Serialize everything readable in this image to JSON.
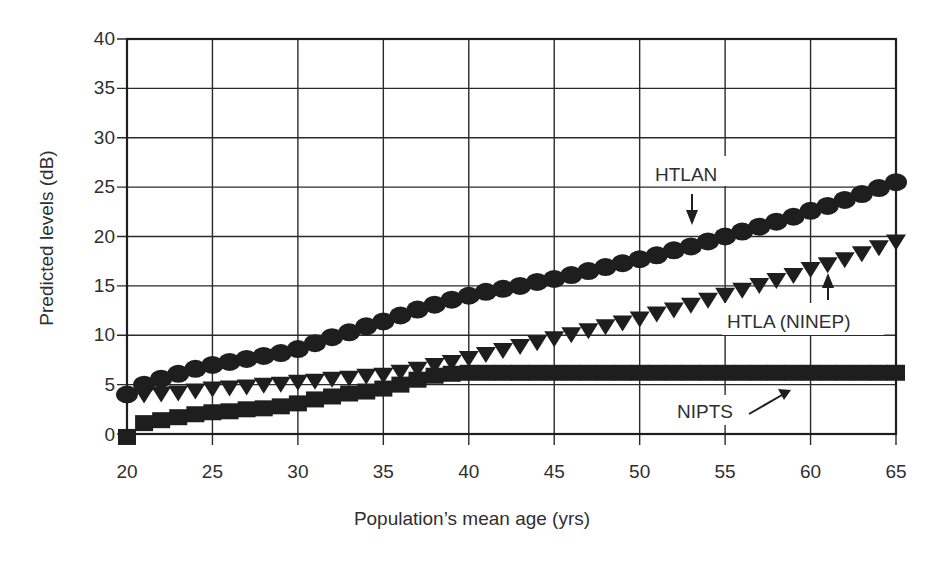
{
  "chart_data": {
    "type": "scatter",
    "title": "",
    "xlabel": "Population’s mean age (yrs)",
    "ylabel": "Predicted levels (dB)",
    "xlim": [
      20,
      65
    ],
    "ylim": [
      0,
      40
    ],
    "x_ticks": [
      20,
      25,
      30,
      35,
      40,
      45,
      50,
      55,
      60,
      65
    ],
    "y_ticks": [
      0,
      5,
      10,
      15,
      20,
      25,
      30,
      35,
      40
    ],
    "grid": true,
    "legend": "none (inline annotations with arrows)",
    "series": [
      {
        "name": "HTLAN",
        "marker": "circle",
        "x": [
          20,
          21,
          22,
          23,
          24,
          25,
          26,
          27,
          28,
          29,
          30,
          31,
          32,
          33,
          34,
          35,
          36,
          37,
          38,
          39,
          40,
          41,
          42,
          43,
          44,
          45,
          46,
          47,
          48,
          49,
          50,
          51,
          52,
          53,
          54,
          55,
          56,
          57,
          58,
          59,
          60,
          61,
          62,
          63,
          64,
          65
        ],
        "values": [
          4.0,
          5.0,
          5.6,
          6.1,
          6.6,
          7.0,
          7.3,
          7.6,
          7.9,
          8.2,
          8.6,
          9.2,
          9.8,
          10.3,
          10.9,
          11.4,
          12.0,
          12.6,
          13.1,
          13.6,
          14.0,
          14.4,
          14.7,
          15.0,
          15.4,
          15.7,
          16.1,
          16.5,
          16.9,
          17.3,
          17.7,
          18.1,
          18.6,
          19.0,
          19.5,
          20.0,
          20.5,
          21.0,
          21.5,
          22.0,
          22.6,
          23.1,
          23.7,
          24.3,
          24.9,
          25.5
        ]
      },
      {
        "name": "HTLA (NINEP)",
        "marker": "triangle-down",
        "x": [
          21,
          22,
          23,
          24,
          25,
          26,
          27,
          28,
          29,
          30,
          31,
          32,
          33,
          34,
          35,
          36,
          37,
          38,
          39,
          40,
          41,
          42,
          43,
          44,
          45,
          46,
          47,
          48,
          49,
          50,
          51,
          52,
          53,
          54,
          55,
          56,
          57,
          58,
          59,
          60,
          61,
          62,
          63,
          64,
          65
        ],
        "values": [
          4.0,
          4.1,
          4.2,
          4.4,
          4.6,
          4.7,
          4.8,
          5.0,
          5.1,
          5.3,
          5.4,
          5.6,
          5.7,
          5.9,
          6.0,
          6.3,
          6.6,
          7.0,
          7.3,
          7.7,
          8.1,
          8.5,
          8.9,
          9.3,
          9.7,
          10.1,
          10.5,
          10.9,
          11.3,
          11.7,
          12.2,
          12.6,
          13.1,
          13.6,
          14.1,
          14.6,
          15.1,
          15.6,
          16.1,
          16.7,
          17.2,
          17.7,
          18.3,
          18.9,
          19.5
        ]
      },
      {
        "name": "NIPTS",
        "marker": "square",
        "x": [
          20,
          21,
          22,
          23,
          24,
          25,
          26,
          27,
          28,
          29,
          30,
          31,
          32,
          33,
          34,
          35,
          36,
          37,
          38,
          39,
          40,
          41,
          42,
          43,
          44,
          45,
          46,
          47,
          48,
          49,
          50,
          51,
          52,
          53,
          54,
          55,
          56,
          57,
          58,
          59,
          60,
          61,
          62,
          63,
          64,
          65
        ],
        "values": [
          -0.3,
          1.1,
          1.4,
          1.7,
          2.0,
          2.2,
          2.3,
          2.5,
          2.6,
          2.8,
          3.1,
          3.5,
          3.8,
          4.1,
          4.3,
          4.6,
          5.0,
          5.5,
          5.9,
          6.1,
          6.2,
          6.2,
          6.2,
          6.2,
          6.2,
          6.2,
          6.2,
          6.2,
          6.2,
          6.2,
          6.2,
          6.2,
          6.2,
          6.2,
          6.2,
          6.2,
          6.2,
          6.2,
          6.2,
          6.2,
          6.2,
          6.2,
          6.2,
          6.2,
          6.2,
          6.2
        ]
      }
    ],
    "annotations": [
      {
        "text": "HTLAN",
        "series": "HTLAN",
        "arrow": "down",
        "at_x": 53.7
      },
      {
        "text": "HTLA (NINEP)",
        "series": "HTLA (NINEP)",
        "arrow": "up",
        "at_x": 61.4
      },
      {
        "text": "NIPTS",
        "series": "NIPTS",
        "arrow": "diagonal-up-right",
        "at_x": 58.5
      }
    ]
  },
  "colors": {
    "ink": "#1e1e1e",
    "grid": "#2a2a2a",
    "background": "#ffffff",
    "text": "#2f2f2f"
  }
}
